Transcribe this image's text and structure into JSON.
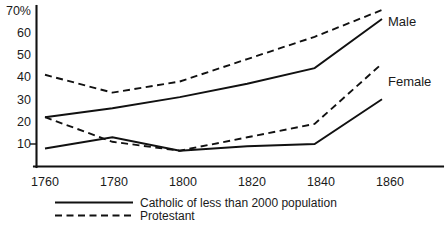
{
  "chart_data": {
    "type": "line",
    "title": "",
    "subtitle": "",
    "xlabel": "",
    "ylabel": "",
    "x": [
      1760,
      1780,
      1800,
      1820,
      1840,
      1860
    ],
    "xtick_labels": [
      "1760",
      "1780",
      "1800",
      "1820",
      "1840",
      "1860"
    ],
    "ytick_labels": [
      "10",
      "20",
      "30",
      "40",
      "50",
      "60",
      "70%"
    ],
    "ytick_values": [
      10,
      20,
      30,
      40,
      50,
      60,
      70
    ],
    "xlim": [
      1760,
      1860
    ],
    "ylim": [
      0,
      72
    ],
    "grid": false,
    "legend_position": "bottom-left",
    "series": [
      {
        "name": "Male Protestant",
        "style": "dashed",
        "annotation": "Male",
        "values": [
          41,
          33,
          38,
          48,
          58,
          70
        ]
      },
      {
        "name": "Male Catholic of less than 2000 population",
        "style": "solid",
        "annotation": "Male",
        "values": [
          22,
          26,
          31,
          37,
          44,
          66
        ]
      },
      {
        "name": "Female Protestant",
        "style": "dashed",
        "annotation": "Female",
        "values": [
          22,
          11,
          7,
          13,
          19,
          46
        ]
      },
      {
        "name": "Female Catholic of less than 2000 population",
        "style": "solid",
        "annotation": "Female",
        "values": [
          8,
          13,
          7,
          9,
          10,
          30
        ]
      }
    ],
    "annotations": [
      {
        "text": "Male",
        "x": 1860,
        "y": 69
      },
      {
        "text": "Female",
        "x": 1860,
        "y": 43
      }
    ],
    "legend": [
      {
        "label": "Catholic of less than 2000 population",
        "style": "solid"
      },
      {
        "label": "Protestant",
        "style": "dashed"
      }
    ],
    "colors": {
      "ink": "#111111",
      "background": "#ffffff"
    }
  }
}
